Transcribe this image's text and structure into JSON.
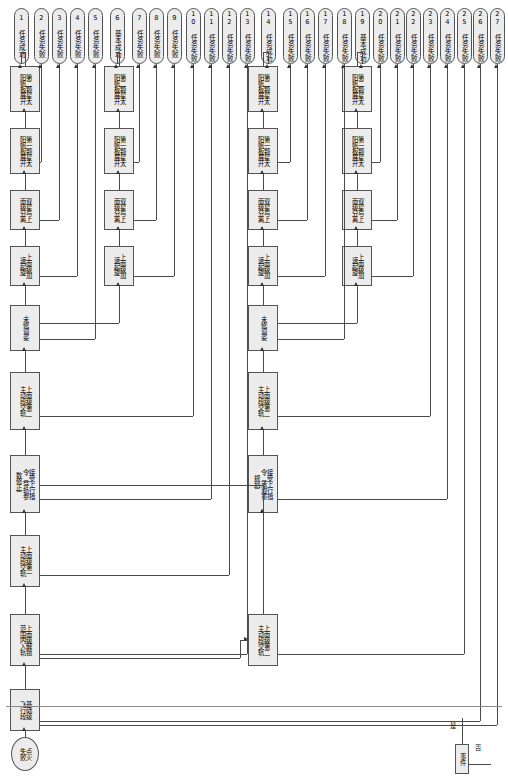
{
  "diagram": {
    "orientation": "rotated-90",
    "legend": {
      "event_label": "事件",
      "yes_label": "是",
      "no_label": "否"
    },
    "start_node": {
      "id": "start",
      "label": "点火\n失败"
    },
    "process_nodes": [
      {
        "id": "p1",
        "label": "基础级\n飞行段"
      },
      {
        "id": "p2",
        "label": "上面级解锁\n范围内入轨"
      },
      {
        "id": "p3",
        "label": "上面级第一\n主动段交轨"
      },
      {
        "id": "p4",
        "label": "接受上行指\n令（导轨参\n数修正）"
      },
      {
        "id": "p5",
        "label": "上面级第二\n主动段交轨"
      },
      {
        "id": "p6",
        "label": "未修调姿"
      },
      {
        "id": "p7",
        "label": "上面级加\n速起旋"
      },
      {
        "id": "p8",
        "label": "双星与上\n面级分离"
      },
      {
        "id": "p9",
        "label": "第一颗星太\n阳帆板展开"
      },
      {
        "id": "p10",
        "label": "第二颗星太\n阳帆板展开"
      },
      {
        "id": "p11",
        "label": "上面级加\n速起旋"
      },
      {
        "id": "p12",
        "label": "双星与上\n面级分离"
      },
      {
        "id": "p13",
        "label": "第一颗星太\n阳帆板展开"
      },
      {
        "id": "p14",
        "label": "第二颗星太\n阳帆板展开"
      },
      {
        "id": "p15",
        "label": "上面级第二\n主动段交轨"
      },
      {
        "id": "p16",
        "label": "接受上行指\n令（承道重\n规划）"
      },
      {
        "id": "p17",
        "label": "上面级第二\n主动段交轨"
      },
      {
        "id": "p18",
        "label": "未修调姿"
      },
      {
        "id": "p19",
        "label": "上面级加\n速起旋"
      },
      {
        "id": "p20",
        "label": "双星与上\n面级分离"
      },
      {
        "id": "p21",
        "label": "第一颗星太\n阳帆板展开"
      },
      {
        "id": "p22",
        "label": "第二颗星太\n阳帆板展开"
      },
      {
        "id": "p23",
        "label": "上面级加\n速起旋"
      },
      {
        "id": "p24",
        "label": "双星与上\n面级分离"
      },
      {
        "id": "p25",
        "label": "第一颗星太\n阳帆板展开"
      },
      {
        "id": "p26",
        "label": "第二颗星太\n阳帆板展开"
      }
    ],
    "terminals": [
      {
        "num": "1",
        "label": "任务成功"
      },
      {
        "num": "2",
        "label": "任务失败"
      },
      {
        "num": "3",
        "label": "任务失败"
      },
      {
        "num": "4",
        "label": "任务失败"
      },
      {
        "num": "5",
        "label": "任务失败"
      },
      {
        "num": "6",
        "label": "基本成功"
      },
      {
        "num": "7",
        "label": "任务失败"
      },
      {
        "num": "8",
        "label": "任务失败"
      },
      {
        "num": "9",
        "label": "任务失败"
      },
      {
        "num": "10",
        "label": "任务失败"
      },
      {
        "num": "11",
        "label": "任务失败"
      },
      {
        "num": "12",
        "label": "任务失败"
      },
      {
        "num": "13",
        "label": "任务失败"
      },
      {
        "num": "14",
        "label": "任务成功"
      },
      {
        "num": "15",
        "label": "任务失败"
      },
      {
        "num": "16",
        "label": "任务失败"
      },
      {
        "num": "17",
        "label": "任务失败"
      },
      {
        "num": "18",
        "label": "任务失败"
      },
      {
        "num": "19",
        "label": "基本成功"
      },
      {
        "num": "20",
        "label": "任务失败"
      },
      {
        "num": "21",
        "label": "任务失败"
      },
      {
        "num": "22",
        "label": "任务失败"
      },
      {
        "num": "23",
        "label": "任务失败"
      },
      {
        "num": "24",
        "label": "任务失败"
      },
      {
        "num": "25",
        "label": "任务失败"
      },
      {
        "num": "26",
        "label": "任务失败"
      },
      {
        "num": "27",
        "label": "任务失败"
      }
    ],
    "colors": {
      "node_fill": "#ececec",
      "node_stroke": "#555555",
      "line": "#4a4a4a",
      "background": "#ffffff"
    }
  }
}
